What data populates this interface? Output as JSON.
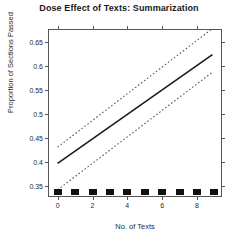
{
  "chart_data": {
    "type": "line",
    "title": "Dose Effect of Texts: Summarization",
    "xlabel": "No. of Texts",
    "ylabel": "Proportion of Sections Passed",
    "xlim": [
      -0.5,
      9.5
    ],
    "ylim": [
      0.325,
      0.675
    ],
    "grid": false,
    "legend": "none",
    "xticks": [
      0,
      2,
      4,
      6,
      8
    ],
    "xtick_labels": [
      "0",
      "2",
      "4",
      "6",
      "8"
    ],
    "yticks": [
      0.35,
      0.4,
      0.45,
      0.5,
      0.55,
      0.6,
      0.65
    ],
    "ytick_labels": [
      "0.35",
      "0.4",
      "0.45",
      "0.5",
      "0.55",
      "0.6",
      "0.65"
    ],
    "series": [
      {
        "name": "fit",
        "style": "solid",
        "color": "#1a1a1a",
        "x": [
          0,
          9
        ],
        "values": [
          0.394,
          0.623
        ]
      },
      {
        "name": "upper-confidence-band",
        "style": "dashed",
        "color": "#555555",
        "x": [
          0,
          9
        ],
        "values": [
          0.428,
          0.678
        ]
      },
      {
        "name": "lower-confidence-band",
        "style": "dashed",
        "color": "#555555",
        "x": [
          0,
          9
        ],
        "values": [
          0.338,
          0.586
        ]
      }
    ],
    "rug": {
      "name": "observation-markers",
      "color": "#111111",
      "x": [
        0,
        1,
        2,
        3,
        4,
        5,
        6,
        7,
        8,
        9
      ],
      "y": 0.337
    }
  }
}
